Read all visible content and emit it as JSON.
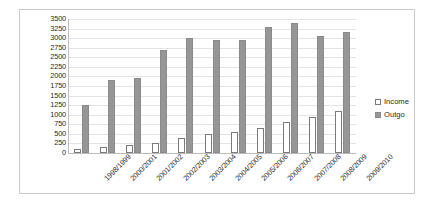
{
  "chart_data": {
    "type": "bar",
    "title": "",
    "xlabel": "",
    "ylabel": "",
    "ylim": [
      0,
      3500
    ],
    "ytick_step": 250,
    "grid": true,
    "legend_position": "right",
    "categories": [
      "1998/1999",
      "2000/2001",
      "2001/2002",
      "2002/2003",
      "2003/2004",
      "2004/2005",
      "2005/2006",
      "2006/2007",
      "2007/2008",
      "2008/2009",
      "2009/2010"
    ],
    "ytick_labels": [
      "3500",
      "3250",
      "3000",
      "2750",
      "2500",
      "2250",
      "2000",
      "1750",
      "1500",
      "1250",
      "1000",
      "750",
      "500",
      "250",
      "0"
    ],
    "series": [
      {
        "name": "Income",
        "color": "#ffffff",
        "border_color": "#7a7a7a",
        "values": [
          100,
          150,
          200,
          250,
          400,
          500,
          550,
          650,
          800,
          950,
          1100
        ]
      },
      {
        "name": "Outgo",
        "color": "#969696",
        "border_color": "#8a8a8a",
        "values": [
          1250,
          1900,
          1950,
          2700,
          3000,
          2950,
          2950,
          3300,
          3400,
          3050,
          3150
        ]
      }
    ]
  },
  "legend": {
    "items": [
      {
        "label": "Income",
        "swatch": "income-swatch"
      },
      {
        "label": "Outgo",
        "swatch": "outgo-swatch"
      }
    ]
  }
}
